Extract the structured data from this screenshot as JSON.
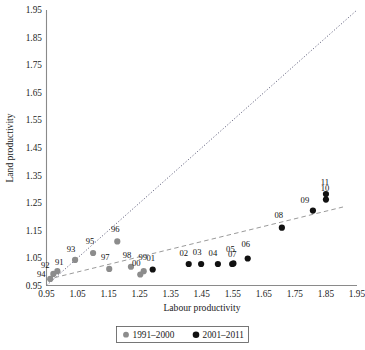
{
  "chart_data": {
    "type": "scatter",
    "title": "",
    "xlabel": "Labour productivity",
    "ylabel": "Land productivity",
    "xlim": [
      0.95,
      1.95
    ],
    "ylim": [
      0.95,
      1.95
    ],
    "xticks": [
      "0.95",
      "1.05",
      "1.15",
      "1.25",
      "1.35",
      "1.45",
      "1.55",
      "1.65",
      "1.75",
      "1.85",
      "1.95"
    ],
    "yticks": [
      "0.95",
      "1.05",
      "1.15",
      "1.25",
      "1.35",
      "1.45",
      "1.55",
      "1.65",
      "1.75",
      "1.85",
      "1.95"
    ],
    "grid": false,
    "legend_position": "bottom-center",
    "series": [
      {
        "name": "1991–2000",
        "color": "#8c8c8c",
        "marker": "circle",
        "points": [
          {
            "label": "91",
            "x": 0.985,
            "y": 1.002,
            "label_dx": 2,
            "label_dy": -4
          },
          {
            "label": "92",
            "x": 0.972,
            "y": 0.992,
            "label_dx": -8,
            "label_dy": -3
          },
          {
            "label": "93",
            "x": 1.042,
            "y": 1.043,
            "label_dx": -4,
            "label_dy": -5
          },
          {
            "label": "94",
            "x": 0.962,
            "y": 0.974,
            "label_dx": -9,
            "label_dy": 1
          },
          {
            "label": "95",
            "x": 1.1,
            "y": 1.068,
            "label_dx": -3,
            "label_dy": -6
          },
          {
            "label": "96",
            "x": 1.178,
            "y": 1.11,
            "label_dx": -2,
            "label_dy": -7
          },
          {
            "label": "97",
            "x": 1.152,
            "y": 1.01,
            "label_dx": -4,
            "label_dy": -6
          },
          {
            "label": "98",
            "x": 1.222,
            "y": 1.018,
            "label_dx": -4,
            "label_dy": -6
          },
          {
            "label": "99",
            "x": 1.263,
            "y": 1.002,
            "label_dx": -1,
            "label_dy": -9
          },
          {
            "label": "00",
            "x": 1.252,
            "y": 0.99,
            "label_dx": -4,
            "label_dy": -6
          }
        ]
      },
      {
        "name": "2001–2011",
        "color": "#111111",
        "marker": "circle",
        "points": [
          {
            "label": "01",
            "x": 1.292,
            "y": 1.008,
            "label_dx": -2,
            "label_dy": -6
          },
          {
            "label": "02",
            "x": 1.408,
            "y": 1.028,
            "label_dx": -5,
            "label_dy": -6
          },
          {
            "label": "03",
            "x": 1.448,
            "y": 1.028,
            "label_dx": -4,
            "label_dy": -7
          },
          {
            "label": "04",
            "x": 1.502,
            "y": 1.028,
            "label_dx": -5,
            "label_dy": -6
          },
          {
            "label": "05",
            "x": 1.552,
            "y": 1.03,
            "label_dx": -3,
            "label_dy": -9
          },
          {
            "label": "06",
            "x": 1.598,
            "y": 1.048,
            "label_dx": -2,
            "label_dy": -9
          },
          {
            "label": "07",
            "x": 1.548,
            "y": 1.028,
            "label_dx": 0,
            "label_dy": -5
          },
          {
            "label": "08",
            "x": 1.708,
            "y": 1.16,
            "label_dx": -3,
            "label_dy": -7
          },
          {
            "label": "09",
            "x": 1.808,
            "y": 1.222,
            "label_dx": -8,
            "label_dy": -5
          },
          {
            "label": "10",
            "x": 1.85,
            "y": 1.262,
            "label_dx": -1,
            "label_dy": -6
          },
          {
            "label": "11",
            "x": 1.85,
            "y": 1.282,
            "label_dx": -1,
            "label_dy": -7
          }
        ]
      }
    ],
    "reference_line": {
      "name": "identity-line",
      "style": "dotted",
      "x1": 0.95,
      "y1": 0.95,
      "x2": 1.95,
      "y2": 1.95
    },
    "trend_line": {
      "name": "trend-line",
      "style": "dashed",
      "x1": 0.952,
      "y1": 0.972,
      "x2": 1.905,
      "y2": 1.235
    }
  },
  "legend": {
    "entries": [
      {
        "label": "1991–2000",
        "color": "#8c8c8c"
      },
      {
        "label": "2001–2011",
        "color": "#111111"
      }
    ]
  }
}
